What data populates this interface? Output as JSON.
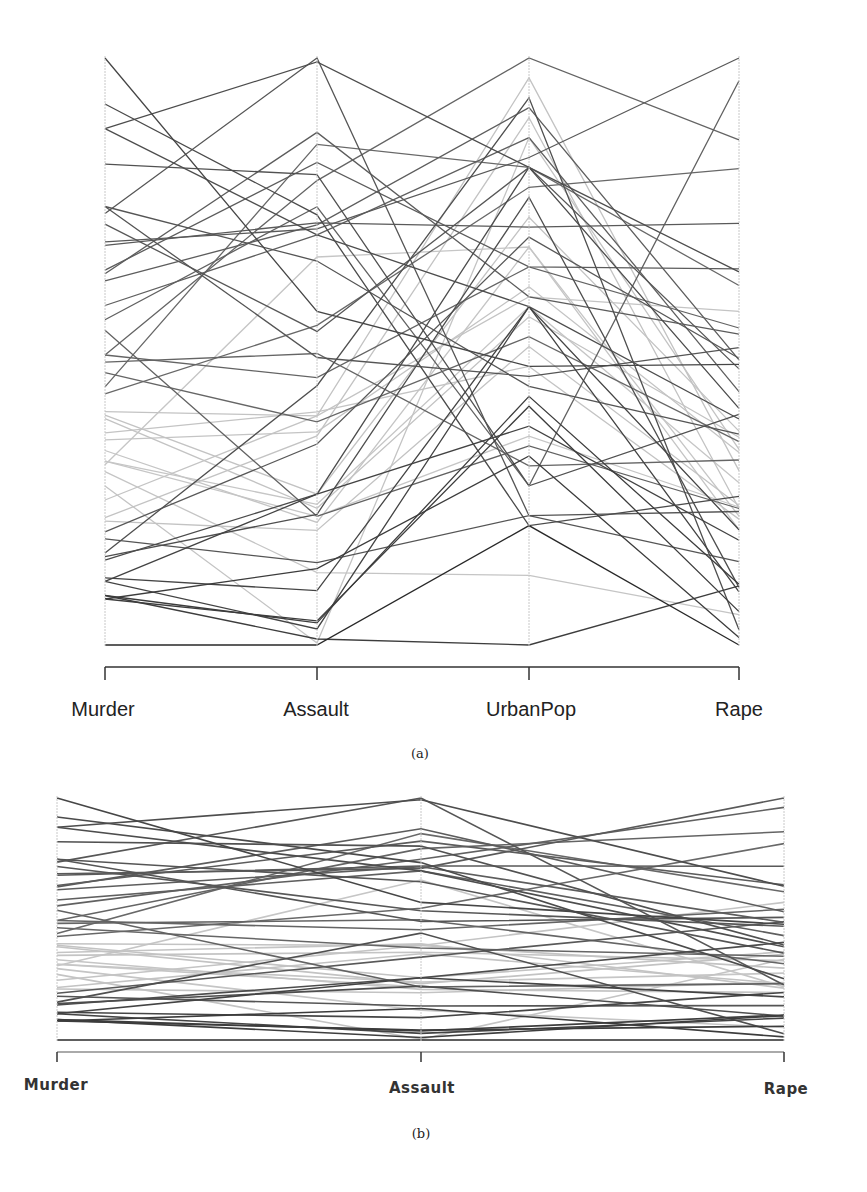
{
  "chart_data": [
    {
      "type": "parallel_coordinates",
      "panel": "a",
      "caption": "(a)",
      "axes": [
        "Murder",
        "Assault",
        "UrbanPop",
        "Rape"
      ],
      "ranges": {
        "Murder": [
          0.8,
          17.4
        ],
        "Assault": [
          45,
          337
        ],
        "UrbanPop": [
          32,
          91
        ],
        "Rape": [
          7.3,
          46.0
        ]
      },
      "grid": false,
      "legend": null,
      "color_encoding": "grayscale by Murder value",
      "records": [
        {
          "state": "Alabama",
          "Murder": 13.2,
          "Assault": 236,
          "UrbanPop": 58,
          "Rape": 21.2
        },
        {
          "state": "Alaska",
          "Murder": 10.0,
          "Assault": 263,
          "UrbanPop": 48,
          "Rape": 44.5
        },
        {
          "state": "Arizona",
          "Murder": 8.1,
          "Assault": 294,
          "UrbanPop": 80,
          "Rape": 31.0
        },
        {
          "state": "Arkansas",
          "Murder": 8.8,
          "Assault": 190,
          "UrbanPop": 50,
          "Rape": 19.5
        },
        {
          "state": "California",
          "Murder": 9.0,
          "Assault": 276,
          "UrbanPop": 91,
          "Rape": 40.6
        },
        {
          "state": "Colorado",
          "Murder": 7.9,
          "Assault": 204,
          "UrbanPop": 78,
          "Rape": 38.7
        },
        {
          "state": "Connecticut",
          "Murder": 3.3,
          "Assault": 110,
          "UrbanPop": 77,
          "Rape": 11.1
        },
        {
          "state": "Delaware",
          "Murder": 5.9,
          "Assault": 238,
          "UrbanPop": 72,
          "Rape": 15.8
        },
        {
          "state": "Florida",
          "Murder": 15.4,
          "Assault": 335,
          "UrbanPop": 80,
          "Rape": 31.9
        },
        {
          "state": "Georgia",
          "Murder": 17.4,
          "Assault": 211,
          "UrbanPop": 60,
          "Rape": 25.8
        },
        {
          "state": "Hawaii",
          "Murder": 5.3,
          "Assault": 46,
          "UrbanPop": 83,
          "Rape": 20.2
        },
        {
          "state": "Idaho",
          "Murder": 2.6,
          "Assault": 120,
          "UrbanPop": 54,
          "Rape": 14.2
        },
        {
          "state": "Illinois",
          "Murder": 10.4,
          "Assault": 249,
          "UrbanPop": 83,
          "Rape": 24.0
        },
        {
          "state": "Indiana",
          "Murder": 7.2,
          "Assault": 113,
          "UrbanPop": 65,
          "Rape": 21.0
        },
        {
          "state": "Iowa",
          "Murder": 2.2,
          "Assault": 56,
          "UrbanPop": 57,
          "Rape": 11.3
        },
        {
          "state": "Kansas",
          "Murder": 6.0,
          "Assault": 115,
          "UrbanPop": 66,
          "Rape": 18.0
        },
        {
          "state": "Kentucky",
          "Murder": 9.7,
          "Assault": 109,
          "UrbanPop": 52,
          "Rape": 16.3
        },
        {
          "state": "Louisiana",
          "Murder": 15.4,
          "Assault": 249,
          "UrbanPop": 66,
          "Rape": 22.2
        },
        {
          "state": "Maine",
          "Murder": 2.1,
          "Assault": 83,
          "UrbanPop": 51,
          "Rape": 7.8
        },
        {
          "state": "Maryland",
          "Murder": 11.3,
          "Assault": 300,
          "UrbanPop": 67,
          "Rape": 27.8
        },
        {
          "state": "Massachusetts",
          "Murder": 4.4,
          "Assault": 149,
          "UrbanPop": 85,
          "Rape": 16.3
        },
        {
          "state": "Michigan",
          "Murder": 12.1,
          "Assault": 255,
          "UrbanPop": 74,
          "Rape": 35.1
        },
        {
          "state": "Minnesota",
          "Murder": 2.7,
          "Assault": 72,
          "UrbanPop": 66,
          "Rape": 14.9
        },
        {
          "state": "Mississippi",
          "Murder": 16.1,
          "Assault": 259,
          "UrbanPop": 44,
          "Rape": 17.1
        },
        {
          "state": "Missouri",
          "Murder": 9.0,
          "Assault": 178,
          "UrbanPop": 70,
          "Rape": 28.2
        },
        {
          "state": "Montana",
          "Murder": 6.0,
          "Assault": 109,
          "UrbanPop": 53,
          "Rape": 16.4
        },
        {
          "state": "Nebraska",
          "Murder": 4.3,
          "Assault": 102,
          "UrbanPop": 62,
          "Rape": 16.5
        },
        {
          "state": "Nevada",
          "Murder": 12.2,
          "Assault": 252,
          "UrbanPop": 81,
          "Rape": 46.0
        },
        {
          "state": "New Hampshire",
          "Murder": 2.1,
          "Assault": 57,
          "UrbanPop": 56,
          "Rape": 9.5
        },
        {
          "state": "New Jersey",
          "Murder": 7.4,
          "Assault": 159,
          "UrbanPop": 89,
          "Rape": 18.8
        },
        {
          "state": "New Mexico",
          "Murder": 11.4,
          "Assault": 285,
          "UrbanPop": 70,
          "Rape": 32.1
        },
        {
          "state": "New York",
          "Murder": 11.1,
          "Assault": 254,
          "UrbanPop": 86,
          "Rape": 26.1
        },
        {
          "state": "North Carolina",
          "Murder": 13.0,
          "Assault": 337,
          "UrbanPop": 45,
          "Rape": 16.1
        },
        {
          "state": "North Dakota",
          "Murder": 0.8,
          "Assault": 45,
          "UrbanPop": 44,
          "Rape": 7.3
        },
        {
          "state": "Ohio",
          "Murder": 7.3,
          "Assault": 120,
          "UrbanPop": 75,
          "Rape": 21.4
        },
        {
          "state": "Oklahoma",
          "Murder": 6.6,
          "Assault": 151,
          "UrbanPop": 68,
          "Rape": 20.0
        },
        {
          "state": "Oregon",
          "Murder": 4.9,
          "Assault": 159,
          "UrbanPop": 67,
          "Rape": 29.3
        },
        {
          "state": "Pennsylvania",
          "Murder": 6.3,
          "Assault": 106,
          "UrbanPop": 72,
          "Rape": 14.9
        },
        {
          "state": "Rhode Island",
          "Murder": 3.4,
          "Assault": 174,
          "UrbanPop": 87,
          "Rape": 8.3
        },
        {
          "state": "South Carolina",
          "Murder": 14.4,
          "Assault": 279,
          "UrbanPop": 48,
          "Rape": 22.5
        },
        {
          "state": "South Dakota",
          "Murder": 3.8,
          "Assault": 86,
          "UrbanPop": 45,
          "Rape": 12.8
        },
        {
          "state": "Tennessee",
          "Murder": 13.2,
          "Assault": 188,
          "UrbanPop": 59,
          "Rape": 26.9
        },
        {
          "state": "Texas",
          "Murder": 12.7,
          "Assault": 201,
          "UrbanPop": 80,
          "Rape": 25.5
        },
        {
          "state": "Utah",
          "Murder": 3.2,
          "Assault": 120,
          "UrbanPop": 80,
          "Rape": 22.9
        },
        {
          "state": "Vermont",
          "Murder": 2.2,
          "Assault": 48,
          "UrbanPop": 32,
          "Rape": 11.2
        },
        {
          "state": "Virginia",
          "Murder": 8.5,
          "Assault": 156,
          "UrbanPop": 63,
          "Rape": 20.7
        },
        {
          "state": "Washington",
          "Murder": 4.0,
          "Assault": 145,
          "UrbanPop": 73,
          "Rape": 26.2
        },
        {
          "state": "West Virginia",
          "Murder": 5.7,
          "Assault": 81,
          "UrbanPop": 39,
          "Rape": 9.3
        },
        {
          "state": "Wisconsin",
          "Murder": 2.6,
          "Assault": 53,
          "UrbanPop": 66,
          "Rape": 10.8
        },
        {
          "state": "Wyoming",
          "Murder": 6.8,
          "Assault": 161,
          "UrbanPop": 60,
          "Rape": 15.6
        }
      ]
    },
    {
      "type": "parallel_coordinates",
      "panel": "b",
      "caption": "(b)",
      "axes": [
        "Murder",
        "Assault",
        "Rape"
      ],
      "grid": false,
      "legend": null,
      "color_encoding": "grayscale by Murder value",
      "records_ref": "same records as panel a, UrbanPop axis omitted"
    }
  ],
  "panel_a": {
    "labels": [
      "Murder",
      "Assault",
      "UrbanPop",
      "Rape"
    ],
    "caption": "(a)"
  },
  "panel_b": {
    "labels": [
      "Murder",
      "Assault",
      "Rape"
    ],
    "caption": "(b)"
  },
  "colors": {
    "axis_line": "#c8c8c8",
    "bracket": "#333333",
    "dark_line": "#3a3a3a",
    "light_line": "#c4c4c4"
  }
}
